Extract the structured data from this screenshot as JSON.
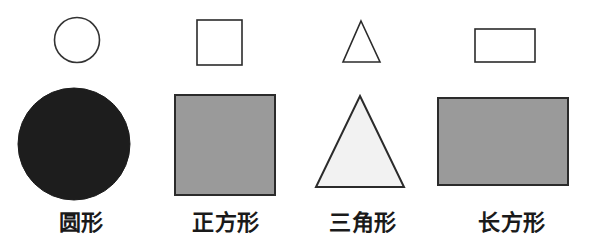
{
  "page": {
    "background_color": "#ffffff",
    "width": 594,
    "height": 247,
    "row_count": 2,
    "column_count": 4
  },
  "palette": {
    "outline": "#2b2b2b",
    "outline_small": "#333333",
    "white_fill": "#ffffff",
    "black_fill": "#1d1d1d",
    "grey_fill": "#9a9a9a",
    "light_grey_fill": "#f2f2f2",
    "label_color": "#1a1a1a"
  },
  "columns": [
    {
      "label": "圆形",
      "shape_name": "circle",
      "small": {
        "icon_name": "circle-outline-icon",
        "fill": "#ffffff",
        "stroke": "#333333",
        "stroke_width": 1.6,
        "cx": 77,
        "cy": 40,
        "r": 22.5
      },
      "large": {
        "icon_name": "circle-filled-icon",
        "fill": "#1d1d1d",
        "stroke": "#1d1d1d",
        "stroke_width": 1,
        "cx": 74,
        "cy": 144,
        "r": 56
      },
      "label_center_x": 81
    },
    {
      "label": "正方形",
      "shape_name": "square",
      "small": {
        "icon_name": "square-outline-icon",
        "fill": "#ffffff",
        "stroke": "#2b2b2b",
        "stroke_width": 1.6,
        "x": 197,
        "y": 20,
        "width": 45,
        "height": 45
      },
      "large": {
        "icon_name": "square-filled-icon",
        "fill": "#9a9a9a",
        "stroke": "#2b2b2b",
        "stroke_width": 2,
        "x": 175,
        "y": 95,
        "width": 100,
        "height": 100
      },
      "label_center_x": 226
    },
    {
      "label": "三角形",
      "shape_name": "triangle",
      "small": {
        "icon_name": "triangle-outline-icon",
        "fill": "#ffffff",
        "stroke": "#2b2b2b",
        "stroke_width": 1.6,
        "points": "361,21 380,62 343,62"
      },
      "large": {
        "icon_name": "triangle-filled-icon",
        "fill": "#f2f2f2",
        "stroke": "#2b2b2b",
        "stroke_width": 2,
        "points": "360,96 404,187 316,187"
      },
      "label_center_x": 363
    },
    {
      "label": "长方形",
      "shape_name": "rectangle",
      "small": {
        "icon_name": "rectangle-outline-icon",
        "fill": "#ffffff",
        "stroke": "#2b2b2b",
        "stroke_width": 1.6,
        "x": 475,
        "y": 29,
        "width": 60,
        "height": 33
      },
      "large": {
        "icon_name": "rectangle-filled-icon",
        "fill": "#9a9a9a",
        "stroke": "#2b2b2b",
        "stroke_width": 2,
        "x": 438,
        "y": 98,
        "width": 130,
        "height": 87
      },
      "label_center_x": 512
    }
  ]
}
